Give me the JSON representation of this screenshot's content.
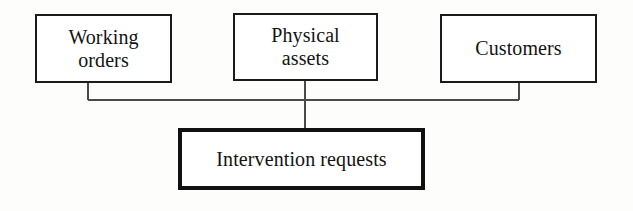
{
  "diagram": {
    "type": "block-relationship-diagram",
    "background_color": "#fdfdfb",
    "line_color": "#4a4a4a",
    "border_color": "#1b1b1b",
    "text_color": "#141414",
    "nodes": [
      {
        "id": "working-orders",
        "label": "Working\norders",
        "border_weight": "thin",
        "row": "top"
      },
      {
        "id": "physical-assets",
        "label": "Physical\nassets",
        "border_weight": "thin",
        "row": "top"
      },
      {
        "id": "customers",
        "label": "Customers",
        "border_weight": "thin",
        "row": "top"
      },
      {
        "id": "intervention-requests",
        "label": "Intervention requests",
        "border_weight": "thick",
        "row": "bottom"
      }
    ],
    "edges": [
      {
        "from": "working-orders",
        "to": "intervention-requests"
      },
      {
        "from": "physical-assets",
        "to": "intervention-requests"
      },
      {
        "from": "customers",
        "to": "intervention-requests"
      }
    ]
  }
}
